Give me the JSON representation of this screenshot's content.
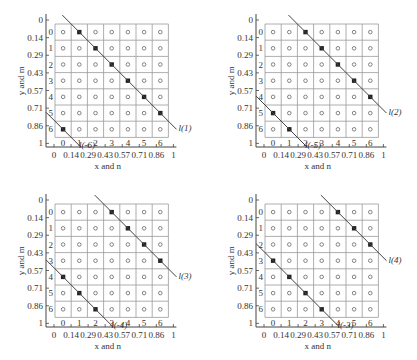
{
  "axes": {
    "xlabel": "x and n",
    "ylabel": "y and m",
    "x_ticks": [
      "0",
      "0.14",
      "0.29",
      "0.43",
      "0.57",
      "0.71",
      "0.86",
      "1"
    ],
    "y_ticks": [
      "0",
      "0.14",
      "0.29",
      "0.43",
      "0.57",
      "0.71",
      "0.86",
      "1"
    ],
    "n_labels": [
      "0",
      "1",
      "2",
      "3",
      "4",
      "5",
      "6"
    ],
    "m_labels": [
      "0",
      "1",
      "2",
      "3",
      "4",
      "5",
      "6"
    ]
  },
  "grid_size": 7,
  "panels": [
    {
      "id": 1,
      "main_label": "l(1)",
      "wrap_label": "l(-6)",
      "wrap_sub": "2",
      "shift": 1
    },
    {
      "id": 2,
      "main_label": "l(2)",
      "wrap_label": "l(-5)",
      "wrap_sub": "3",
      "shift": 2
    },
    {
      "id": 3,
      "main_label": "l(3)",
      "wrap_label": "l(-4)",
      "wrap_sub": "4",
      "shift": 3
    },
    {
      "id": 4,
      "main_label": "l(4)",
      "wrap_label": "l(-3)",
      "wrap_sub": "5",
      "shift": 4
    }
  ],
  "colors": {
    "grid": "#999999",
    "line": "#444444",
    "dot": "#222222",
    "circle": "#666666"
  }
}
